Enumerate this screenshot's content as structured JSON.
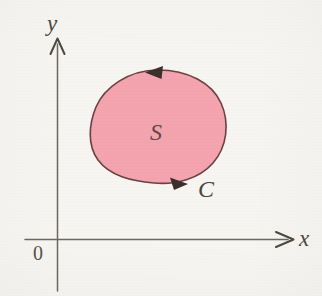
{
  "figure": {
    "background_color": "#f7f5f1"
  },
  "axes": {
    "x_axis": {
      "label": "x",
      "color": "#6b6860",
      "arrowhead": "open-arrow-right",
      "start_x": 25,
      "end_x": 294,
      "y": 239
    },
    "y_axis": {
      "label": "y",
      "color": "#6b6860",
      "arrowhead": "open-arrow-up",
      "x": 57,
      "top_y": 38,
      "bottom_y": 291
    },
    "origin": {
      "label": "0",
      "x": 57,
      "y": 239
    }
  },
  "region": {
    "label": "S",
    "fill_color": "#f4a4ae",
    "stroke_color": "#6b413f",
    "label_x": 158,
    "label_y": 133,
    "bounds": {
      "left": 91,
      "right": 225,
      "top": 70,
      "bottom": 183
    }
  },
  "curve": {
    "label": "C",
    "orientation": "clockwise",
    "stroke_color": "#6b413f",
    "label_x": 207,
    "label_y": 190,
    "arrows": [
      {
        "name": "top-arrow",
        "direction": "left",
        "x": 155,
        "y": 72
      },
      {
        "name": "bottom-arrow",
        "direction": "right",
        "x": 178,
        "y": 180
      }
    ]
  }
}
